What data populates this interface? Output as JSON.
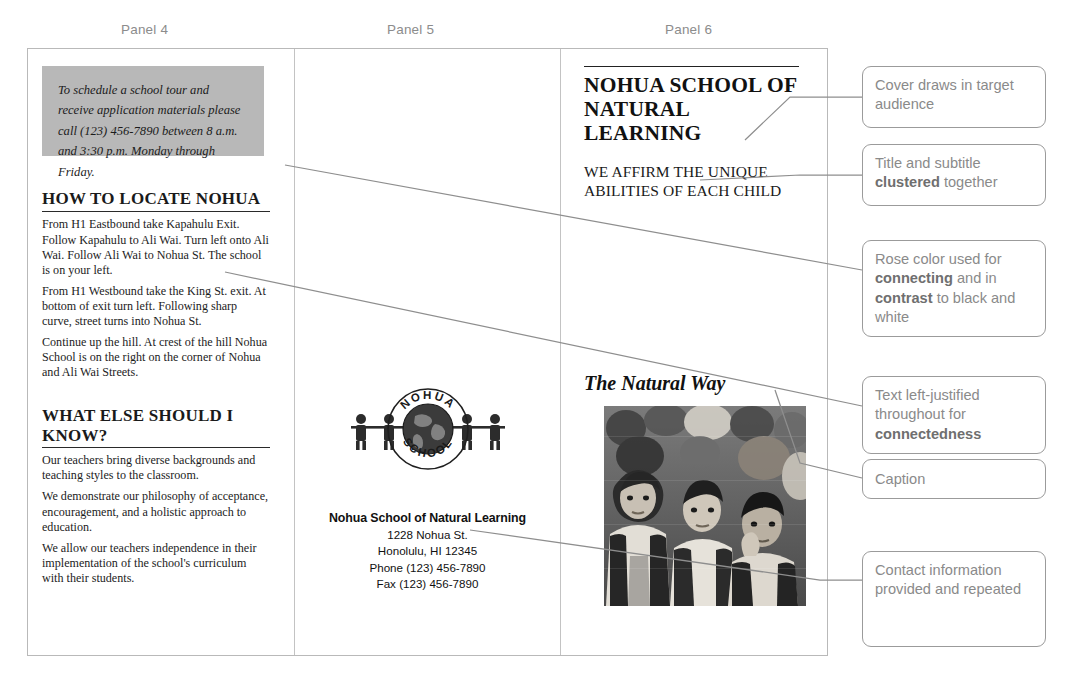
{
  "panel_labels": [
    {
      "text": "Panel 4"
    },
    {
      "text": "Panel 5"
    },
    {
      "text": "Panel 6"
    }
  ],
  "panel4": {
    "callout_box": "To schedule a school tour and receive application materials please call (123) 456-7890 between 8 a.m. and 3:30 p.m. Monday through Friday.",
    "section1": {
      "heading": "HOW TO LOCATE NOHUA",
      "paragraphs": [
        "From H1 Eastbound take Kapahulu Exit. Follow Kapahulu to Ali Wai. Turn left onto Ali Wai. Follow Ali Wai to Nohua St. The school is on your left.",
        "From H1 Westbound take the King St. exit. At bottom of exit turn left. Following sharp curve, street turns into Nohua St.",
        "Continue up the hill. At crest of the hill Nohua School is on the right on the corner of Nohua and Ali Wai Streets."
      ]
    },
    "section2": {
      "heading": "WHAT ELSE SHOULD I KNOW?",
      "paragraphs": [
        "Our teachers bring diverse backgrounds and teaching styles to the classroom.",
        "We demonstrate our philosophy of acceptance, encouragement, and a holistic approach to education.",
        "We allow our teachers independence in their implementation of the school's curriculum with their students."
      ]
    }
  },
  "panel5": {
    "logo": {
      "name": "nohua-school-seal-logo",
      "top_text": "NOHUA",
      "bottom_text": "SCHOOL"
    },
    "contact": {
      "org": "Nohua School of Natural Learning",
      "street": "1228 Nohua St.",
      "city": "Honolulu, HI 12345",
      "phone": "Phone (123) 456-7890",
      "fax": "Fax (123) 456-7890"
    }
  },
  "panel6": {
    "title": "NOHUA SCHOOL OF NATURAL LEARNING",
    "subtitle": "WE AFFIRM THE UNIQUE ABILITIES OF EACH CHILD",
    "caption": "The Natural Way",
    "photo_alt": "group-of-children-photo"
  },
  "annotations": [
    {
      "id": "cover",
      "text": "Cover draws in target audience"
    },
    {
      "id": "title-subtitle",
      "pre": "Title and subtitle ",
      "bold": "clustered",
      "post": " together"
    },
    {
      "id": "rose-color",
      "line1_pre": "Rose color used for ",
      "line1_bold": "connecting",
      "line2_pre": " and in ",
      "line2_bold": "contrast",
      "line2_post": " to black and white"
    },
    {
      "id": "left-justified",
      "pre": "Text left-justified throughout for ",
      "bold": "connectedness",
      "post": ""
    },
    {
      "id": "caption",
      "text": "Caption"
    },
    {
      "id": "contact",
      "text": "Contact information provided and repeated"
    }
  ],
  "colors": {
    "gray_box": "#b8b8b8",
    "annotation_border": "#9b9b9b",
    "annotation_text": "#8a8a8a",
    "brochure_border": "#b9b9b9",
    "panel_label": "#8c8c8c"
  }
}
